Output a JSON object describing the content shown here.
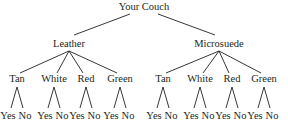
{
  "diagram": {
    "type": "tree",
    "root": {
      "label": "Your Couch",
      "children": [
        {
          "label": "Leather",
          "children": [
            {
              "label": "Tan",
              "children": [
                {
                  "label": "Yes"
                },
                {
                  "label": "No"
                }
              ]
            },
            {
              "label": "White",
              "children": [
                {
                  "label": "Yes"
                },
                {
                  "label": "No"
                }
              ]
            },
            {
              "label": "Red",
              "children": [
                {
                  "label": "Yes"
                },
                {
                  "label": "No"
                }
              ]
            },
            {
              "label": "Green",
              "children": [
                {
                  "label": "Yes"
                },
                {
                  "label": "No"
                }
              ]
            }
          ]
        },
        {
          "label": "Microsuede",
          "children": [
            {
              "label": "Tan",
              "children": [
                {
                  "label": "Yes"
                },
                {
                  "label": "No"
                }
              ]
            },
            {
              "label": "White",
              "children": [
                {
                  "label": "Yes"
                },
                {
                  "label": "No"
                }
              ]
            },
            {
              "label": "Red",
              "children": [
                {
                  "label": "Yes"
                },
                {
                  "label": "No"
                }
              ]
            },
            {
              "label": "Green",
              "children": [
                {
                  "label": "Yes"
                },
                {
                  "label": "No"
                }
              ]
            }
          ]
        }
      ]
    }
  }
}
